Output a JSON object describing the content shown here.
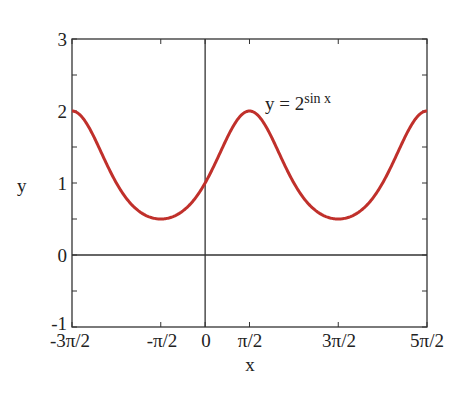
{
  "chart_data": {
    "type": "line",
    "title": "",
    "annotation": {
      "base": "y = 2",
      "exponent": "sin x"
    },
    "xlabel": "x",
    "ylabel": "y",
    "xlim": [
      -4.712389,
      7.853982
    ],
    "ylim": [
      -1,
      3
    ],
    "xticks": [
      -4.712389,
      -1.570796,
      0,
      1.570796,
      4.712389,
      7.853982
    ],
    "xtick_labels": [
      "-3π/2",
      "-π/2",
      "0",
      "π/2",
      "3π/2",
      "5π/2"
    ],
    "yticks": [
      -1,
      0,
      1,
      2,
      3
    ],
    "ytick_labels": [
      "-1",
      "0",
      "1",
      "2",
      "3"
    ],
    "grid": false,
    "axes_lines": {
      "x0": true,
      "y0": true
    },
    "series": [
      {
        "name": "y = 2^sin x",
        "color": "#c0302b",
        "function": "2^sin(x)",
        "x": [
          -4.712,
          -3.927,
          -3.142,
          -2.356,
          -1.571,
          -0.785,
          0,
          0.785,
          1.571,
          2.356,
          3.142,
          3.927,
          4.712,
          5.498,
          6.283,
          7.069,
          7.854
        ],
        "y": [
          2.0,
          1.633,
          1.0,
          0.613,
          0.5,
          0.613,
          1.0,
          1.633,
          2.0,
          1.633,
          1.0,
          0.613,
          0.5,
          0.613,
          1.0,
          1.633,
          2.0
        ]
      }
    ]
  },
  "labels": {
    "ylabel": "y",
    "xlabel": "x",
    "annot_base": "y = 2",
    "annot_exp": "sin x",
    "yticks": [
      "3",
      "2",
      "1",
      "0",
      "-1"
    ],
    "xticks": [
      "-3π/2",
      "-π/2",
      "0",
      "π/2",
      "3π/2",
      "5π/2"
    ]
  }
}
